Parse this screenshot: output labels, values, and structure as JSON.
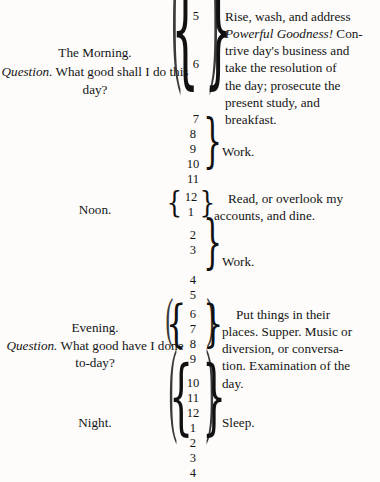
{
  "document": {
    "type": "scanned-book-page",
    "title": "Daily Schedule Table",
    "background_color": "#fdfcfa",
    "text_color": "#141414"
  },
  "sections": [
    {
      "id": "morning",
      "label": "The Morning.",
      "question_prefix": "Question.",
      "question_text": "What good shall I do this day?",
      "hours": [
        "5",
        "6",
        "7"
      ],
      "description_lines": [
        "Rise, wash, and address",
        "Powerful Goodness! Con-",
        "trive day's business and",
        "take the resolution of",
        "the day; prosecute the",
        "present study, and",
        "breakfast."
      ],
      "description_italic_fragment": "Powerful Goodness!",
      "brace_left": true,
      "brace_right": true,
      "paren_outer": true
    },
    {
      "id": "morning-work",
      "label": "",
      "hours": [
        "8",
        "9",
        "10",
        "11"
      ],
      "description_lines": [
        "Work."
      ],
      "brace_left": false,
      "brace_right": true,
      "paren_outer": false
    },
    {
      "id": "noon",
      "label": "Noon.",
      "hours": [
        "12",
        "1"
      ],
      "description_lines": [
        "Read, or overlook my",
        "accounts, and dine."
      ],
      "brace_left": true,
      "brace_right": true,
      "paren_outer": false
    },
    {
      "id": "afternoon-work",
      "label": "",
      "hours": [
        "2",
        "3",
        "4",
        "5"
      ],
      "description_lines": [
        "Work."
      ],
      "brace_left": false,
      "brace_right": true,
      "paren_outer": false
    },
    {
      "id": "evening",
      "label": "Evening.",
      "question_prefix": "Question.",
      "question_text": "What good have I done to-day?",
      "hours": [
        "6",
        "7",
        "8",
        "9"
      ],
      "description_lines": [
        "Put things in their",
        "places. Supper. Music or",
        "diversion, or conversa-",
        "tion. Examination of the",
        "day."
      ],
      "brace_left": true,
      "brace_right": true,
      "paren_outer": true
    },
    {
      "id": "night",
      "label": "Night.",
      "hours": [
        "10",
        "11",
        "12",
        "1",
        "2",
        "3",
        "4"
      ],
      "description_lines": [
        "Sleep."
      ],
      "brace_left": true,
      "brace_right": true,
      "paren_outer": true
    }
  ],
  "glyphs": {
    "brace_left": "{",
    "brace_right": "}",
    "paren_left": "(",
    "paren_right": ")"
  }
}
